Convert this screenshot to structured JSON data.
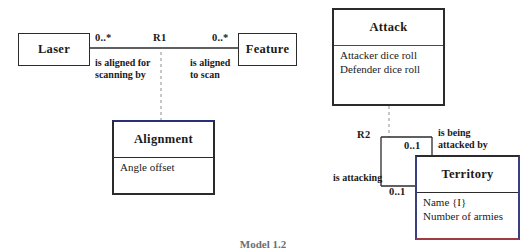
{
  "diagram": {
    "type": "uml-class-diagram",
    "caption": "Model 1.2",
    "colors": {
      "stroke": "#2b2b2b",
      "navy_accent": "#2a2f73",
      "green_divider": "#2c5f3f",
      "red_accent": "#9e3b43",
      "dashed": "#8f8f8f",
      "background": "#ffffff"
    }
  },
  "left_model": {
    "relationship_id": "R1",
    "classes": {
      "laser": {
        "name": "Laser",
        "attributes": []
      },
      "feature": {
        "name": "Feature",
        "attributes": []
      },
      "alignment": {
        "name": "Alignment",
        "attributes": [
          "Angle offset"
        ],
        "kind": "association-class"
      }
    },
    "ends": [
      {
        "side": "left",
        "multiplicity": "0..*",
        "role_line1": "is aligned for",
        "role_line2": "scanning by"
      },
      {
        "side": "right",
        "multiplicity": "0..*",
        "role_line1": "is aligned",
        "role_line2": "to scan"
      }
    ]
  },
  "right_model": {
    "relationship_id": "R2",
    "classes": {
      "attack": {
        "name": "Attack",
        "attributes": [
          "Attacker dice roll",
          "Defender dice roll"
        ],
        "kind": "association-class"
      },
      "territory": {
        "name": "Territory",
        "attributes": [
          "Name  {I}",
          "Number of armies"
        ]
      }
    },
    "ends": [
      {
        "side": "top",
        "multiplicity": "0..1",
        "role_line1": "is being",
        "role_line2": "attacked by"
      },
      {
        "side": "bottom",
        "multiplicity": "0..1",
        "role_line1": "is attacking",
        "role_line2": ""
      }
    ]
  }
}
